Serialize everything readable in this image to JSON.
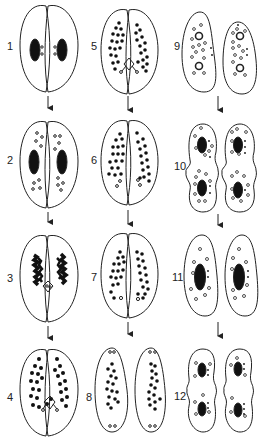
{
  "figure": {
    "columns": 3,
    "rows": 4,
    "line_color": "#222222",
    "fill_color": "#ffffff"
  },
  "stages": [
    {
      "id": 1,
      "label": "1",
      "col": 0,
      "row": 0,
      "type": "paired",
      "content": "macronucleus pair with small micronuclei"
    },
    {
      "id": 2,
      "label": "2",
      "col": 0,
      "row": 1,
      "type": "paired",
      "content": "macronuclei with dividing micronuclei"
    },
    {
      "id": 3,
      "label": "3",
      "col": 0,
      "row": 2,
      "type": "paired",
      "content": "fragmenting macronuclei"
    },
    {
      "id": 4,
      "label": "4",
      "col": 0,
      "row": 3,
      "type": "paired",
      "content": "dense fragments with exchanging pronuclei"
    },
    {
      "id": 5,
      "label": "5",
      "col": 1,
      "row": 0,
      "type": "paired",
      "content": "dense fragments with pronuclei exchange"
    },
    {
      "id": 6,
      "label": "6",
      "col": 1,
      "row": 1,
      "type": "paired",
      "content": "fragments with small open nuclei"
    },
    {
      "id": 7,
      "label": "7",
      "col": 1,
      "row": 2,
      "type": "paired",
      "content": "fragments with single open nucleus"
    },
    {
      "id": 8,
      "label": "8",
      "col": 1,
      "row": 3,
      "type": "separated",
      "content": "exconjugants with fragments"
    },
    {
      "id": 9,
      "label": "9",
      "col": 2,
      "row": 0,
      "type": "separated",
      "content": "open rings and granules"
    },
    {
      "id": 10,
      "label": "10",
      "col": 2,
      "row": 1,
      "type": "dividing",
      "content": "dividing cells with two macronuclei"
    },
    {
      "id": 11,
      "label": "11",
      "col": 2,
      "row": 2,
      "type": "separated",
      "content": "single macronucleus with granules"
    },
    {
      "id": 12,
      "label": "12",
      "col": 2,
      "row": 3,
      "type": "dividing",
      "content": "final division"
    }
  ],
  "labels": {
    "s1": "1",
    "s2": "2",
    "s3": "3",
    "s4": "4",
    "s5": "5",
    "s6": "6",
    "s7": "7",
    "s8": "8",
    "s9": "9",
    "s10": "10",
    "s11": "11",
    "s12": "12"
  }
}
